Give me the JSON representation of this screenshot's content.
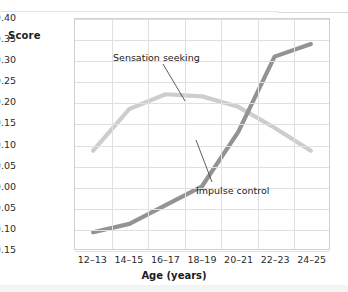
{
  "axis": {
    "y_label": "Score",
    "x_label": "Age (years)",
    "y_ticks": [
      "0.40",
      "0.35",
      "0.30",
      "0.25",
      "0.20",
      "0.15",
      "0.10",
      "0.05",
      "0.00",
      "−0.05",
      "−0.10",
      "−0.15"
    ],
    "x_ticks": [
      "12–13",
      "14–15",
      "16–17",
      "18–19",
      "20–21",
      "22–23",
      "24–25"
    ]
  },
  "annotations": {
    "sensation": "Sensation seeking",
    "impulse": "Impulse control"
  },
  "colors": {
    "sensation_seeking": "#cdcdcd",
    "impulse_control": "#939393",
    "grid": "#e0e0e0",
    "border": "#d0d0d0",
    "text": "#2b2b2b"
  },
  "chart_data": {
    "type": "line",
    "title": "",
    "xlabel": "Age (years)",
    "ylabel": "Score",
    "categories": [
      "12–13",
      "14–15",
      "16–17",
      "18–19",
      "20–21",
      "22–23",
      "24–25"
    ],
    "ylim": [
      -0.15,
      0.4
    ],
    "ytick_step": 0.05,
    "grid": true,
    "legend": "inline-annotations",
    "series": [
      {
        "name": "Sensation seeking",
        "color": "#cdcdcd",
        "values": [
          0.085,
          0.185,
          0.22,
          0.215,
          0.19,
          0.14,
          0.085
        ]
      },
      {
        "name": "Impulse control",
        "color": "#939393",
        "values": [
          -0.11,
          -0.09,
          -0.045,
          0.0,
          0.13,
          0.31,
          0.34
        ]
      }
    ]
  }
}
